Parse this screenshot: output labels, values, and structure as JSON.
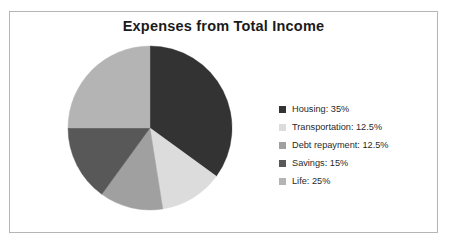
{
  "figure": {
    "border_color": "#b5b5b5",
    "background": "#ffffff"
  },
  "title": "Expenses from Total Income",
  "legend": {
    "position": "right",
    "entries": [
      {
        "label": "Housing: 35%",
        "color": "#333333"
      },
      {
        "label": "Transportation: 12.5%",
        "color": "#dcdcdc"
      },
      {
        "label": "Debt repayment: 12.5%",
        "color": "#a0a0a0"
      },
      {
        "label": "Savings: 15%",
        "color": "#585858"
      },
      {
        "label": "Life: 25%",
        "color": "#b4b4b4"
      }
    ]
  },
  "chart_data": {
    "type": "pie",
    "title": "Expenses from Total Income",
    "xlabel": "",
    "ylabel": "",
    "categories": [
      "Housing",
      "Transportation",
      "Debt repayment",
      "Savings",
      "Life"
    ],
    "values": [
      35,
      12.5,
      12.5,
      15,
      25
    ],
    "value_unit": "%",
    "labels": [
      "Housing: 35%",
      "Transportation: 12.5%",
      "Debt repayment: 12.5%",
      "Savings: 15%",
      "Life: 25%"
    ],
    "colors": [
      "#333333",
      "#dcdcdc",
      "#a0a0a0",
      "#585858",
      "#b4b4b4"
    ],
    "start_angle_deg": 0,
    "direction": "clockwise",
    "legend_position": "right",
    "grid": false,
    "data_labels_on_slices": false
  }
}
